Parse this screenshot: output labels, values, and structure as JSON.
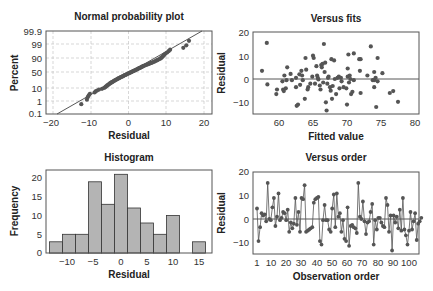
{
  "chart_data": [
    {
      "id": "npp",
      "type": "scatter",
      "title": "Normal probability plot",
      "xlabel": "Residual",
      "ylabel": "Percent",
      "xlim": [
        -22,
        22
      ],
      "x_ticks": [
        "-20",
        "-10",
        "0",
        "10",
        "20"
      ],
      "y_ticks": [
        "99.9",
        "99",
        "90",
        "50",
        "10",
        "1",
        "0.1"
      ],
      "grid": true,
      "reference_line": "fitted normal line from (-19, 0.1) to (22, 99.9)",
      "points_residual": [
        -12.5,
        -11,
        -10.8,
        -10.5,
        -10.2,
        -9,
        -8.7,
        -8.3,
        -7.8,
        -7,
        -6.5,
        -6.2,
        -6,
        -5.8,
        -5.6,
        -5.4,
        -5.2,
        -5,
        -4.8,
        -4.6,
        -4.4,
        -4.2,
        -4,
        -3.8,
        -3.6,
        -3.4,
        -3.2,
        -3,
        -2.8,
        -2.6,
        -2.4,
        -2.2,
        -2,
        -1.8,
        -1.6,
        -1.4,
        -1.2,
        -1,
        -0.8,
        -0.6,
        -0.4,
        -0.2,
        0,
        0.2,
        0.4,
        0.6,
        0.8,
        1,
        1.2,
        1.4,
        1.6,
        1.8,
        2,
        2.2,
        2.4,
        2.6,
        2.8,
        3,
        3.2,
        3.4,
        3.6,
        3.8,
        4,
        4.3,
        4.6,
        4.9,
        5.2,
        5.5,
        5.8,
        6.1,
        6.4,
        6.7,
        7,
        7.3,
        7.6,
        7.9,
        8.2,
        8.5,
        8.7,
        8.9,
        9.1,
        9.3,
        9.5,
        9.8,
        10.2,
        10.6,
        11,
        14.5,
        15.3,
        16
      ]
    },
    {
      "id": "vfits",
      "type": "scatter",
      "title": "Versus fits",
      "xlabel": "Fitted value",
      "ylabel": "Residual",
      "xlim": [
        56,
        80.5
      ],
      "ylim": [
        -15,
        20
      ],
      "x_ticks": [
        "60",
        "65",
        "70",
        "75",
        "80"
      ],
      "y_ticks": [
        "20",
        "10",
        "0",
        "-10"
      ],
      "reference_line_y": 0,
      "points": [
        [
          57.5,
          3.5
        ],
        [
          58.2,
          15.5
        ],
        [
          58.3,
          -2.3
        ],
        [
          59.6,
          -6.5
        ],
        [
          59.7,
          -4.5
        ],
        [
          60.5,
          -1
        ],
        [
          60.6,
          -4.5
        ],
        [
          60.7,
          -5.2
        ],
        [
          60.8,
          1.5
        ],
        [
          61,
          -4
        ],
        [
          61.1,
          -0.5
        ],
        [
          61.2,
          5
        ],
        [
          61.7,
          2.2
        ],
        [
          61.9,
          -0.5
        ],
        [
          62.5,
          -3.5
        ],
        [
          62.5,
          0.5
        ],
        [
          62.6,
          -11.5
        ],
        [
          62.8,
          -11
        ],
        [
          63,
          2
        ],
        [
          63.1,
          -2.5
        ],
        [
          63.3,
          3.5
        ],
        [
          63.4,
          1.5
        ],
        [
          63.5,
          -0.5
        ],
        [
          63.8,
          -8.5
        ],
        [
          63.9,
          9
        ],
        [
          64,
          4
        ],
        [
          64.2,
          -4.5
        ],
        [
          64.3,
          -3.5
        ],
        [
          64.6,
          -2
        ],
        [
          64.9,
          1
        ],
        [
          65,
          10
        ],
        [
          65.1,
          9
        ],
        [
          65.3,
          -2
        ],
        [
          65.5,
          5.5
        ],
        [
          65.6,
          1.5
        ],
        [
          65.7,
          0.5
        ],
        [
          65.8,
          -0.2
        ],
        [
          66,
          -2.8
        ],
        [
          66.1,
          -4.5
        ],
        [
          66.2,
          6
        ],
        [
          66.3,
          5
        ],
        [
          66.4,
          6.5
        ],
        [
          66.5,
          -1.5
        ],
        [
          66.6,
          15
        ],
        [
          66.7,
          3
        ],
        [
          66.8,
          7
        ],
        [
          66.9,
          -10
        ],
        [
          67,
          -13.5
        ],
        [
          67.1,
          -2
        ],
        [
          67.2,
          0.5
        ],
        [
          67.3,
          1
        ],
        [
          67.5,
          -3.5
        ],
        [
          67.6,
          -5
        ],
        [
          67.7,
          8.5
        ],
        [
          67.8,
          -8.5
        ],
        [
          67.9,
          -3
        ],
        [
          68.1,
          8
        ],
        [
          68.2,
          0
        ],
        [
          68.4,
          -6.5
        ],
        [
          68.6,
          0.5
        ],
        [
          68.8,
          1
        ],
        [
          68.9,
          -4
        ],
        [
          69.1,
          0.5
        ],
        [
          69.2,
          -1
        ],
        [
          69.5,
          -3.5
        ],
        [
          69.9,
          -4
        ],
        [
          70,
          -11
        ],
        [
          70.1,
          1
        ],
        [
          70.1,
          4.5
        ],
        [
          70.2,
          10.5
        ],
        [
          70.3,
          -1.5
        ],
        [
          70.4,
          1.5
        ],
        [
          70.5,
          0
        ],
        [
          70.6,
          -6.5
        ],
        [
          70.8,
          -5.5
        ],
        [
          71,
          -0.5
        ],
        [
          71,
          11
        ],
        [
          71.8,
          8.5
        ],
        [
          71.9,
          3.5
        ],
        [
          72,
          -6
        ],
        [
          72,
          8.5
        ],
        [
          73,
          1.5
        ],
        [
          73.5,
          14
        ],
        [
          73.8,
          -0.5
        ],
        [
          74,
          -0.5
        ],
        [
          74,
          3
        ],
        [
          74,
          -3.5
        ],
        [
          74.2,
          0.5
        ],
        [
          74.3,
          -12
        ],
        [
          74.5,
          9
        ],
        [
          74.5,
          -1
        ],
        [
          75.2,
          2.5
        ],
        [
          76.3,
          -6
        ],
        [
          76.8,
          -5.2
        ],
        [
          77.5,
          -9.8
        ]
      ]
    },
    {
      "id": "hist",
      "type": "bar",
      "title": "Histogram",
      "xlabel": "Residual",
      "ylabel": "Frequency",
      "x_ticks": [
        "-10",
        "-5",
        "0",
        "5",
        "10",
        "15"
      ],
      "y_ticks": [
        "20",
        "15",
        "10",
        "5",
        "0"
      ],
      "bin_width": 2.5,
      "bin_centers": [
        -12.5,
        -10,
        -7.5,
        -5,
        -2.5,
        0,
        2.5,
        5,
        7.5,
        10,
        12.5,
        15
      ],
      "values": [
        3,
        5,
        5,
        19,
        13,
        21,
        12,
        8,
        5,
        10,
        0,
        3
      ],
      "ylim": [
        0,
        22
      ]
    },
    {
      "id": "vorder",
      "type": "line",
      "title": "Versus order",
      "xlabel": "Observation order",
      "ylabel": "Residual",
      "ylim": [
        -15,
        20
      ],
      "x_ticks": [
        "1",
        "10",
        "20",
        "30",
        "40",
        "50",
        "60",
        "70",
        "80",
        "90",
        "100"
      ],
      "y_ticks": [
        "20",
        "10",
        "0",
        "-10"
      ],
      "reference_line_y": 0,
      "values": [
        4.5,
        -9.5,
        -3.5,
        2.5,
        1.5,
        2,
        -1,
        15.5,
        0,
        -0.5,
        5,
        9,
        -3,
        1,
        11,
        -0.5,
        0.5,
        3,
        2.5,
        -0.5,
        4,
        -5.5,
        -1.5,
        -4,
        -2,
        9,
        -2.5,
        3,
        -5.5,
        9,
        8.5,
        14.5,
        -5.5,
        -5,
        -4.5,
        -4,
        -3.5,
        7,
        8.5,
        9,
        9.5,
        -9.5,
        -11,
        -0.5,
        6,
        -0.5,
        -0.5,
        -4.5,
        -5.5,
        4.5,
        10.5,
        -3.5,
        11,
        1,
        2.5,
        -5.5,
        -0.5,
        -8.5,
        -9.5,
        5,
        -11.5,
        -3,
        -2.5,
        -3.5,
        -4,
        -6,
        15.5,
        1,
        0,
        7.5,
        -1,
        -6.5,
        -1.5,
        -1,
        3,
        6.5,
        -11,
        -0.5,
        -4.5,
        0.5,
        0.5,
        -1.5,
        -3,
        -3.5,
        9,
        6,
        -5.5,
        1.5,
        -13.5,
        1.5,
        -1.5,
        1,
        -4,
        4,
        -5,
        9,
        -4.5,
        -7,
        -11,
        -5,
        3,
        -4.5,
        -1,
        2.5,
        -9,
        -2,
        -1,
        0.5
      ]
    }
  ]
}
